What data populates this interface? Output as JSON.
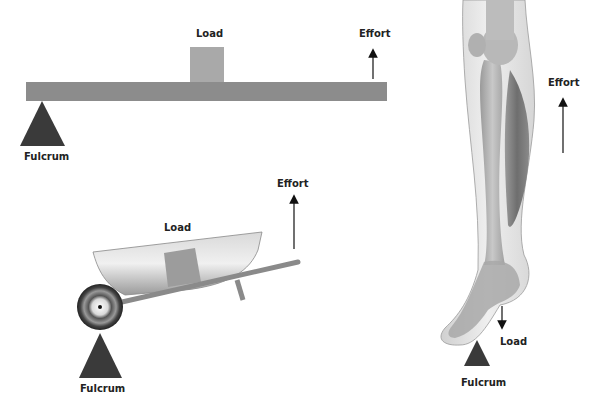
{
  "diagram": {
    "colors": {
      "beam": "#8c8c8c",
      "load_box": "#a9a9a9",
      "fulcrum": "#3a3a3a",
      "arrow": "#111111",
      "label": "#222222",
      "bone": "#b5b5b5",
      "muscle": "#7a7a7a",
      "skin": "#e4e4e4"
    },
    "panels": [
      {
        "id": "lever",
        "labels": {
          "load": "Load",
          "effort": "Effort",
          "fulcrum": "Fulcrum"
        }
      },
      {
        "id": "wheelbarrow",
        "labels": {
          "load": "Load",
          "effort": "Effort",
          "fulcrum": "Fulcrum"
        }
      },
      {
        "id": "leg",
        "labels": {
          "load": "Load",
          "effort": "Effort",
          "fulcrum": "Fulcrum"
        }
      }
    ]
  }
}
